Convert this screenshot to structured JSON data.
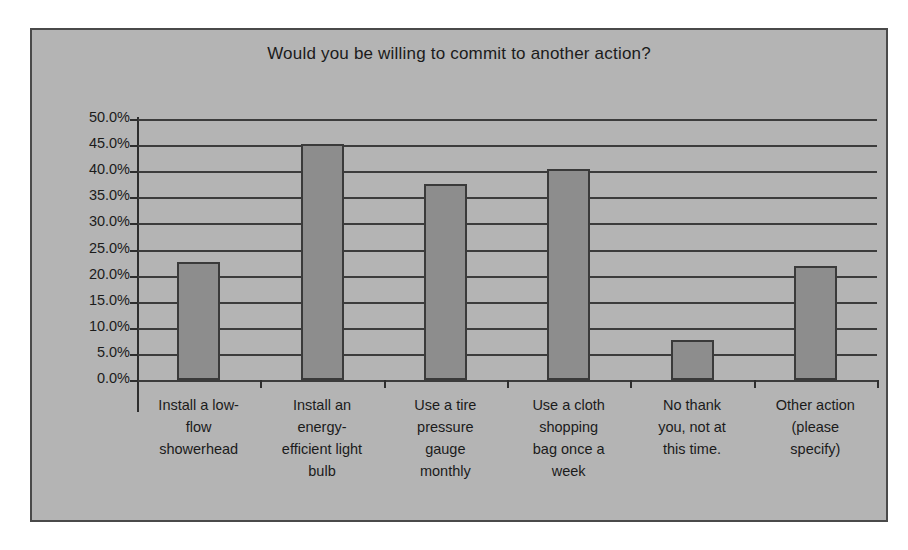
{
  "chart_data": {
    "type": "bar",
    "title": "Would you be willing to commit to another action?",
    "xlabel": "",
    "ylabel": "",
    "ylim": [
      0,
      50
    ],
    "ytick_step": 5,
    "grid": true,
    "legend": false,
    "categories": [
      "Install a low-flow showerhead",
      "Install an energy-efficient light bulb",
      "Use a tire pressure gauge monthly",
      "Use a cloth shopping bag once a week",
      "No thank you, not at this time.",
      "Other action (please specify)"
    ],
    "category_lines": [
      [
        "Install a low-",
        "flow",
        "showerhead"
      ],
      [
        "Install an",
        "energy-",
        "efficient light",
        "bulb"
      ],
      [
        "Use a tire",
        "pressure",
        "gauge",
        "monthly"
      ],
      [
        "Use a cloth",
        "shopping",
        "bag once a",
        "week"
      ],
      [
        "No thank",
        "you, not at",
        "this time."
      ],
      [
        "Other action",
        "(please",
        "specify)"
      ]
    ],
    "values": [
      22.6,
      45.2,
      37.5,
      40.4,
      7.7,
      21.8
    ],
    "ytick_labels": [
      "50.0%",
      "45.0%",
      "40.0%",
      "35.0%",
      "30.0%",
      "25.0%",
      "20.0%",
      "15.0%",
      "10.0%",
      "5.0%",
      "0.0%"
    ],
    "ytick_values": [
      50,
      45,
      40,
      35,
      30,
      25,
      20,
      15,
      10,
      5,
      0
    ],
    "colors": {
      "bar_fill": "#8d8d8d",
      "bar_border": "#3a3a3a",
      "plot_background": "#b4b4b4",
      "gridline": "#3c3c3c",
      "axis": "#2e2e2e",
      "text": "#1b1b1b",
      "frame_border": "#4a4a4a"
    }
  }
}
